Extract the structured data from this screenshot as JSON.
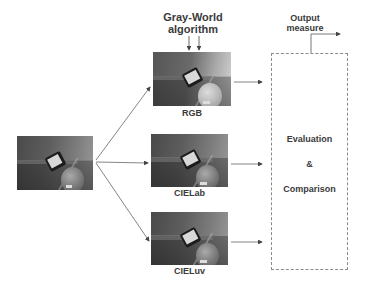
{
  "diagram": {
    "algorithm_label_line1": "Gray-World",
    "algorithm_label_line2": "algorithm",
    "output_label_line1": "Output",
    "output_label_line2": "measure",
    "input_image": {
      "description": "input photo: phone on table with ball"
    },
    "branches": [
      {
        "label": "RGB",
        "description": "Gray-World result in RGB space"
      },
      {
        "label": "CIELab",
        "description": "Gray-World result in CIELab space"
      },
      {
        "label": "CIELuv",
        "description": "Gray-World result in CIELuv space"
      }
    ],
    "evaluation_box": {
      "line1": "Evaluation",
      "line2": "&",
      "line3": "Comparison"
    }
  }
}
